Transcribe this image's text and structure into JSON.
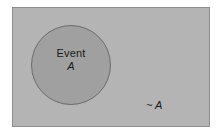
{
  "figure": {
    "type": "venn-diagram",
    "background_color": "#ffffff"
  },
  "sample_space": {
    "name": "sample-space-rectangle",
    "fill_color": "#b4b4b4",
    "border_color": "#8f8f8f"
  },
  "event": {
    "name_label": "Event",
    "symbol_label": "A",
    "fill_color": "#a0a0a0",
    "border_color": "#6b6b6b"
  },
  "complement": {
    "label": "~ A",
    "text_color": "#1a1a1a"
  }
}
